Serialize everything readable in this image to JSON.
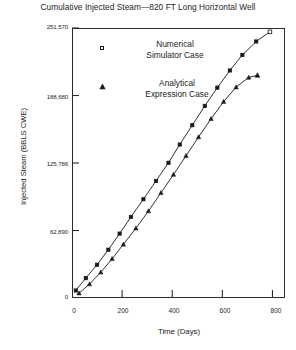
{
  "chart_data": {
    "type": "line",
    "title": "Cumulative Injected Steam—820 FT Long Horizontal Well",
    "xlabel": "Time (Days)",
    "ylabel": "Injected Steam (BBLS CWE)",
    "xlim": [
      0,
      850
    ],
    "ylim": [
      0,
      251570
    ],
    "grid": false,
    "legend_position": "upper-left-inside",
    "xticks": [
      0,
      200,
      400,
      600,
      800
    ],
    "xtick_labels": [
      "0",
      "200",
      "400",
      "600",
      "800"
    ],
    "yticks": [
      0,
      62890,
      125786,
      188680,
      251570
    ],
    "ytick_labels": [
      "0",
      "62,890",
      "125,786",
      "188,680",
      "251,570"
    ],
    "series": [
      {
        "name": "Numerical Simulator Case",
        "marker": "square",
        "color": "#1a1a1a",
        "points": [
          [
            15,
            7000
          ],
          [
            55,
            18500
          ],
          [
            100,
            31000
          ],
          [
            145,
            45000
          ],
          [
            190,
            60000
          ],
          [
            235,
            75500
          ],
          [
            285,
            92000
          ],
          [
            335,
            109000
          ],
          [
            385,
            126000
          ],
          [
            430,
            143000
          ],
          [
            480,
            161000
          ],
          [
            530,
            179000
          ],
          [
            580,
            196000
          ],
          [
            630,
            212000
          ],
          [
            680,
            226500
          ],
          [
            735,
            239000
          ],
          [
            790,
            248000
          ]
        ]
      },
      {
        "name": "Analytical Expression Case",
        "marker": "triangle",
        "color": "#1a1a1a",
        "points": [
          [
            28,
            4500
          ],
          [
            70,
            13000
          ],
          [
            115,
            24000
          ],
          [
            160,
            36500
          ],
          [
            205,
            50000
          ],
          [
            255,
            65000
          ],
          [
            305,
            81000
          ],
          [
            355,
            98000
          ],
          [
            405,
            115000
          ],
          [
            455,
            132500
          ],
          [
            505,
            150000
          ],
          [
            555,
            167000
          ],
          [
            605,
            183000
          ],
          [
            655,
            196500
          ],
          [
            705,
            205500
          ],
          [
            740,
            207500
          ]
        ]
      }
    ]
  },
  "legend": {
    "entries": [
      {
        "label_line1": "Numerical",
        "label_line2": "Simulator Case",
        "marker": "square-marker"
      },
      {
        "label_line1": "Analytical",
        "label_line2": "Expression Case",
        "marker": "triangle-marker"
      }
    ]
  }
}
